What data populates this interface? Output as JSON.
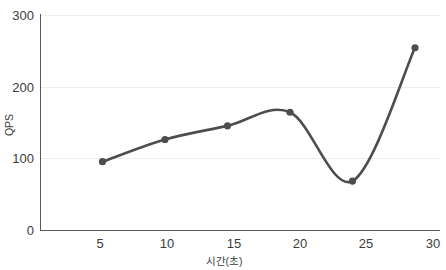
{
  "chart_data": {
    "type": "line",
    "title": "",
    "xlabel": "시간(초)",
    "ylabel": "QPS",
    "x": [
      5,
      10,
      15,
      20,
      25,
      30
    ],
    "values": [
      96,
      127,
      146,
      165,
      69,
      255
    ],
    "series": [
      {
        "name": "QPS",
        "values": [
          96,
          127,
          146,
          165,
          69,
          255
        ]
      }
    ],
    "categories": [
      "5",
      "10",
      "15",
      "20",
      "25",
      "30"
    ],
    "xlim": [
      0,
      32
    ],
    "ylim": [
      0,
      300
    ],
    "x_tick_labels": [
      "5",
      "10",
      "15",
      "20",
      "25",
      "30"
    ],
    "y_tick_labels": [
      "0",
      "100",
      "200",
      "300"
    ],
    "y_ticks": [
      0,
      100,
      200,
      300
    ],
    "grid": "horizontal",
    "legend": "none",
    "smoothing": "spline",
    "marker": "circle",
    "colors": {
      "line": "#4d4d4d",
      "marker": "#4d4d4d",
      "grid": "#ececec",
      "axis": "#5a5a5a",
      "text": "#3c3c3c",
      "background": "#ffffff"
    }
  },
  "axes": {
    "y_title": "QPS",
    "x_title": "시간(초)"
  }
}
